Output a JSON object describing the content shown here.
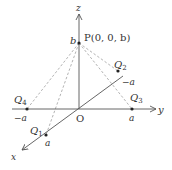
{
  "diagram": {
    "type": "3d-coordinate-axes",
    "colors": {
      "axis": "#555555",
      "dashed": "#aaaaaa",
      "point": "#222222",
      "text": "#333333"
    },
    "axes": {
      "x": {
        "label": "x"
      },
      "y": {
        "label": "y"
      },
      "z": {
        "label": "z"
      }
    },
    "origin": {
      "label": "O"
    },
    "points": {
      "P": {
        "name": "P",
        "label": "P(0, 0, b)",
        "z_tick": "b"
      },
      "Q1": {
        "name": "Q",
        "sub": "1",
        "tick": "a"
      },
      "Q2": {
        "name": "Q",
        "sub": "2",
        "tick": "−a"
      },
      "Q3": {
        "name": "Q",
        "sub": "3",
        "tick": "a"
      },
      "Q4": {
        "name": "Q",
        "sub": "4",
        "tick": "−a"
      }
    }
  }
}
